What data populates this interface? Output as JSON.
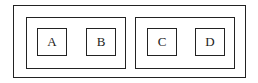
{
  "diagram": {
    "outer_container": {
      "label": ""
    },
    "groups": [
      {
        "items": [
          {
            "label": "A"
          },
          {
            "label": "B"
          }
        ]
      },
      {
        "items": [
          {
            "label": "C"
          },
          {
            "label": "D"
          }
        ]
      }
    ]
  },
  "colors": {
    "stroke": "#222222",
    "background": "#ffffff"
  }
}
